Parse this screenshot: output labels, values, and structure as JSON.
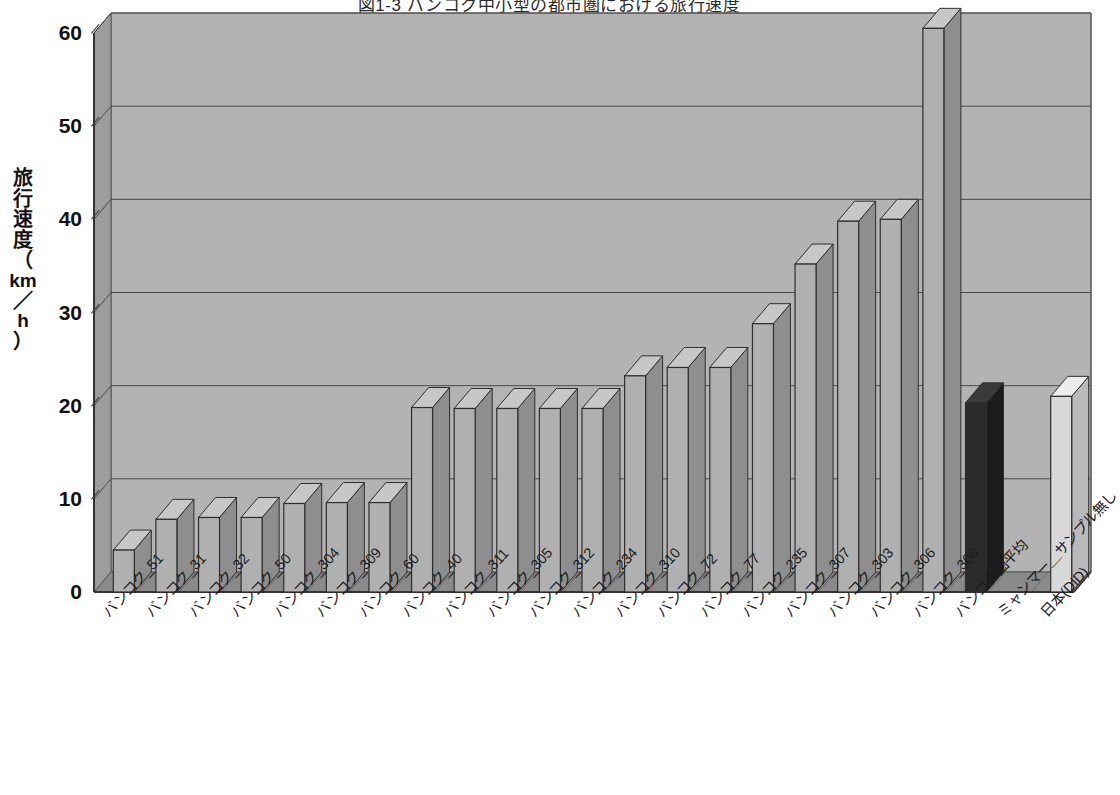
{
  "title": "図1-3  バンコク中小型の都市圏における旅行速度",
  "y_axis_title_chars": [
    "旅",
    "行",
    "速",
    "度",
    "（",
    "km",
    "／",
    "h",
    "）"
  ],
  "colors": {
    "plot_background": "#b3b3b3",
    "floor": "#8a8a8a",
    "bar_default": "#b0b0b0",
    "bar_highlight": "#2b2b2b",
    "bar_last": "#d8d8d8",
    "gridline": "#4a4a4a",
    "text": "#1a1a1a"
  },
  "chart_data": {
    "type": "bar",
    "title": "図1-3  バンコク中小型の都市圏における旅行速度",
    "xlabel": "",
    "ylabel": "旅行速度（km／h）",
    "ylim": [
      0,
      60
    ],
    "yticks": [
      0,
      10,
      20,
      30,
      40,
      50,
      60
    ],
    "ytick_labels": [
      "0",
      "10",
      "20",
      "30",
      "40",
      "50",
      "60"
    ],
    "grid": true,
    "legend": null,
    "categories": [
      "バンコク_51",
      "バンコク_31",
      "バンコク_32",
      "バンコク_50",
      "バンコク_304",
      "バンコク_309",
      "バンコク_60",
      "バンコク_40",
      "バンコク_311",
      "バンコク_305",
      "バンコク_312",
      "バンコク_234",
      "バンコク_310",
      "バンコク_72",
      "バンコク_77",
      "バンコク_235",
      "バンコク_307",
      "バンコク_303",
      "バンコク_306",
      "バンコク_308",
      "バンコク圏平均",
      "ミャンマー＿サンプル無し",
      "日本(DID)"
    ],
    "values": [
      4.5,
      7.8,
      8.0,
      8.0,
      9.5,
      9.6,
      9.6,
      19.8,
      19.7,
      19.7,
      19.7,
      19.7,
      23.2,
      24.1,
      24.1,
      28.8,
      35.2,
      39.8,
      40.0,
      60.5,
      20.3,
      null,
      21.0
    ],
    "bar_styles": [
      "default",
      "default",
      "default",
      "default",
      "default",
      "default",
      "default",
      "default",
      "default",
      "default",
      "default",
      "default",
      "default",
      "default",
      "default",
      "default",
      "default",
      "default",
      "default",
      "default",
      "highlight",
      "none",
      "last"
    ]
  }
}
